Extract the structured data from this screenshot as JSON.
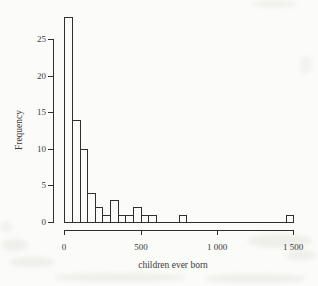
{
  "colors": {
    "paper": "#fbfbf9",
    "line": "#2f2f2f",
    "text": "#3a3a3a",
    "bar_fill": "#fbfbf9"
  },
  "chart_data": {
    "type": "bar",
    "subtype": "histogram",
    "title": "",
    "xlabel": "children ever born",
    "ylabel": "Frequency",
    "xlim": [
      0,
      1500
    ],
    "ylim": [
      0,
      28
    ],
    "bin_width": 50,
    "bin_starts": [
      0,
      50,
      100,
      150,
      200,
      250,
      300,
      350,
      400,
      450,
      500,
      550,
      600,
      650,
      700,
      750,
      800,
      850,
      900,
      950,
      1000,
      1050,
      1100,
      1150,
      1200,
      1250,
      1300,
      1350,
      1400,
      1450
    ],
    "frequencies": [
      28,
      14,
      10,
      4,
      2,
      1,
      3,
      1,
      1,
      2,
      1,
      1,
      0,
      0,
      0,
      1,
      0,
      0,
      0,
      0,
      0,
      0,
      0,
      0,
      0,
      0,
      0,
      0,
      0,
      1
    ],
    "x_ticks": [
      {
        "value": 0,
        "label": "0"
      },
      {
        "value": 500,
        "label": "500"
      },
      {
        "value": 1000,
        "label": "1 000"
      },
      {
        "value": 1500,
        "label": "1 500"
      }
    ],
    "y_ticks": [
      {
        "value": 0,
        "label": "0"
      },
      {
        "value": 5,
        "label": "5"
      },
      {
        "value": 10,
        "label": "10"
      },
      {
        "value": 15,
        "label": "15"
      },
      {
        "value": 20,
        "label": "20"
      },
      {
        "value": 25,
        "label": "25"
      }
    ],
    "legend": null,
    "grid": false
  }
}
